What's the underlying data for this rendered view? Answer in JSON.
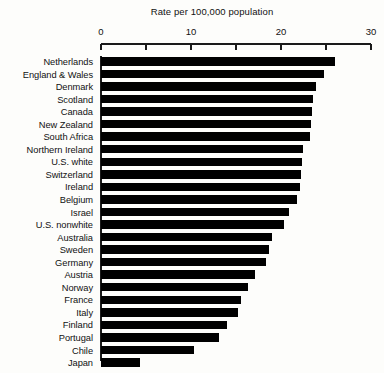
{
  "chart_data": {
    "type": "bar",
    "orientation": "horizontal",
    "title": "Rate per 100,000 population",
    "xlabel": "Rate per 100,000 population",
    "ylabel": "",
    "xlim": [
      0,
      30
    ],
    "xticks": [
      0,
      5,
      10,
      15,
      20,
      25,
      30
    ],
    "xtick_labels": [
      "0",
      "",
      "10",
      "",
      "20",
      "",
      "30"
    ],
    "grid": false,
    "legend": null,
    "categories": [
      "Netherlands",
      "England & Wales",
      "Denmark",
      "Scotland",
      "Canada",
      "New Zealand",
      "South Africa",
      "Northern Ireland",
      "U.S. white",
      "Switzerland",
      "Ireland",
      "Belgium",
      "Israel",
      "U.S. nonwhite",
      "Australia",
      "Sweden",
      "Germany",
      "Austria",
      "Norway",
      "France",
      "Italy",
      "Finland",
      "Portugal",
      "Chile",
      "Japan"
    ],
    "values": [
      26.0,
      24.8,
      23.9,
      23.6,
      23.4,
      23.3,
      23.2,
      22.4,
      22.3,
      22.2,
      22.1,
      21.8,
      20.9,
      20.3,
      19.0,
      18.7,
      18.3,
      17.1,
      16.3,
      15.6,
      15.2,
      14.0,
      13.1,
      10.3,
      4.3
    ]
  },
  "colors": {
    "bar": "#000000",
    "axis": "#1a1a1a",
    "text": "#111111",
    "background": "#fdfdfb"
  }
}
